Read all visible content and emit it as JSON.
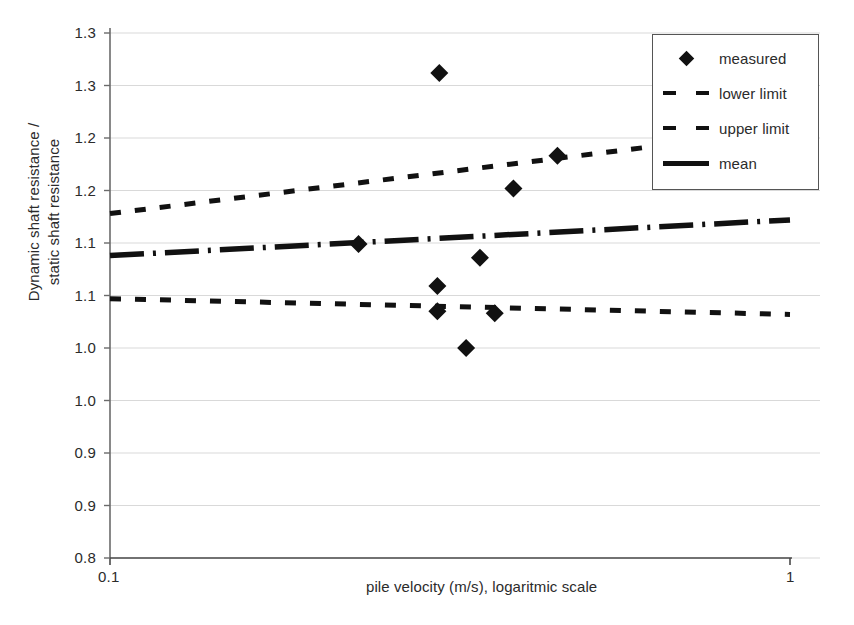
{
  "chart_data": {
    "type": "scatter",
    "title": "",
    "xlabel": "pile velocity (m/s), logaritmic scale",
    "ylabel_line1": "Dynamic shaft resistance /",
    "ylabel_line2": "static shaft resistance",
    "xscale": "log",
    "xlim": [
      0.1,
      1.0
    ],
    "ylim": [
      0.8,
      1.3
    ],
    "grid": true,
    "grid_axis": "y",
    "xtick_labels": [
      "0.1",
      "1"
    ],
    "xtick_values": [
      0.1,
      1.0
    ],
    "ytick_labels": [
      "1.3",
      "1.3",
      "1.2",
      "1.2",
      "1.1",
      "1.1",
      "1.0",
      "1.0",
      "0.9",
      "0.9",
      "0.8"
    ],
    "ytick_values": [
      1.3,
      1.25,
      1.2,
      1.15,
      1.1,
      1.05,
      1.0,
      0.95,
      0.9,
      0.85,
      0.8
    ],
    "legend_position": "top-right",
    "legend": [
      {
        "label": "measured",
        "style": "marker-diamond"
      },
      {
        "label": "lower limit",
        "style": "dashed"
      },
      {
        "label": "upper limit",
        "style": "dashed"
      },
      {
        "label": "mean",
        "style": "solid-thick"
      }
    ],
    "series": [
      {
        "name": "measured",
        "type": "scatter",
        "marker": "diamond",
        "color": "#111111",
        "points": [
          {
            "x": 0.305,
            "y": 1.262
          },
          {
            "x": 0.232,
            "y": 1.099
          },
          {
            "x": 0.455,
            "y": 1.183
          },
          {
            "x": 0.392,
            "y": 1.152
          },
          {
            "x": 0.35,
            "y": 1.086
          },
          {
            "x": 0.303,
            "y": 1.059
          },
          {
            "x": 0.303,
            "y": 1.035
          },
          {
            "x": 0.368,
            "y": 1.033
          },
          {
            "x": 0.334,
            "y": 1.0
          }
        ]
      },
      {
        "name": "upper limit",
        "type": "line",
        "style": "dashed",
        "color": "#111111",
        "x": [
          0.1,
          1.0
        ],
        "y": [
          1.128,
          1.208
        ]
      },
      {
        "name": "mean",
        "type": "line",
        "style": "solid-thick",
        "color": "#111111",
        "x": [
          0.1,
          1.0
        ],
        "y": [
          1.088,
          1.122
        ]
      },
      {
        "name": "lower limit",
        "type": "line",
        "style": "dashed",
        "color": "#111111",
        "x": [
          0.1,
          1.0
        ],
        "y": [
          1.047,
          1.032
        ]
      }
    ]
  }
}
